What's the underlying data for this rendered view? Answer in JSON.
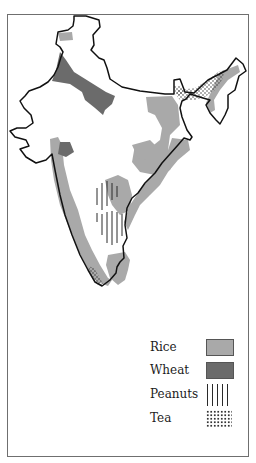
{
  "legend": {
    "items": [
      {
        "label": "Rice",
        "pattern": "solid",
        "color": "#a9a9a9"
      },
      {
        "label": "Wheat",
        "pattern": "solid",
        "color": "#6b6b6b"
      },
      {
        "label": "Peanuts",
        "pattern": "vertical-lines",
        "color": "#2a2a2a"
      },
      {
        "label": "Tea",
        "pattern": "dots",
        "color": "#333333"
      }
    ]
  },
  "colors": {
    "rice": "#a9a9a9",
    "wheat": "#6b6b6b",
    "outline": "#111111",
    "frame": "#6f6f6f"
  }
}
